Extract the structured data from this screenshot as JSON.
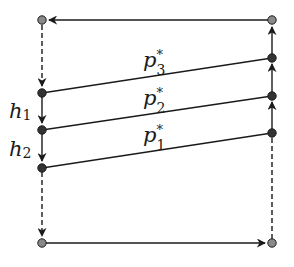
{
  "diagram": {
    "colors": {
      "line": "#1a1a1a",
      "node_dark": "#333333",
      "node_light": "#8a8a8a"
    },
    "nodes": {
      "left": [
        {
          "id": "L_top",
          "x": 42,
          "y": 20,
          "style": "light"
        },
        {
          "id": "L1",
          "x": 42,
          "y": 93,
          "style": "dark"
        },
        {
          "id": "L2",
          "x": 42,
          "y": 130,
          "style": "dark"
        },
        {
          "id": "L3",
          "x": 42,
          "y": 168,
          "style": "dark"
        },
        {
          "id": "L_bottom",
          "x": 42,
          "y": 243,
          "style": "light"
        }
      ],
      "right": [
        {
          "id": "R_top",
          "x": 272,
          "y": 20,
          "style": "light"
        },
        {
          "id": "R3",
          "x": 272,
          "y": 58,
          "style": "dark"
        },
        {
          "id": "R2",
          "x": 272,
          "y": 96,
          "style": "dark"
        },
        {
          "id": "R1",
          "x": 272,
          "y": 133,
          "style": "dark"
        },
        {
          "id": "R_bottom",
          "x": 272,
          "y": 243,
          "style": "light"
        }
      ]
    },
    "edges": [
      {
        "from": "R_top",
        "to": "L_top",
        "style": "solid",
        "arrow": true
      },
      {
        "from": "L_top",
        "to": "L1",
        "style": "dashed",
        "arrow": true
      },
      {
        "from": "L1",
        "to": "L2",
        "style": "solid",
        "arrow": true,
        "label": "h1"
      },
      {
        "from": "L2",
        "to": "L3",
        "style": "solid",
        "arrow": true,
        "label": "h2"
      },
      {
        "from": "L3",
        "to": "L_bottom",
        "style": "dashed",
        "arrow": true
      },
      {
        "from": "L_bottom",
        "to": "R_bottom",
        "style": "solid",
        "arrow": true
      },
      {
        "from": "R_bottom",
        "to": "R1",
        "style": "dashed",
        "arrow": false
      },
      {
        "from": "R1",
        "to": "R2",
        "style": "solid",
        "arrow": true
      },
      {
        "from": "R2",
        "to": "R3",
        "style": "solid",
        "arrow": true
      },
      {
        "from": "R3",
        "to": "R_top",
        "style": "solid",
        "arrow": true
      },
      {
        "from": "L1",
        "to": "R3",
        "style": "solid",
        "arrow": false,
        "label": "p3*"
      },
      {
        "from": "L2",
        "to": "R2",
        "style": "solid",
        "arrow": false,
        "label": "p2*"
      },
      {
        "from": "L3",
        "to": "R1",
        "style": "solid",
        "arrow": false,
        "label": "p1*"
      }
    ],
    "labels": {
      "h1": {
        "base": "h",
        "sub": "1"
      },
      "h2": {
        "base": "h",
        "sub": "2"
      },
      "p3": {
        "base": "p",
        "sup": "*",
        "sub": "3"
      },
      "p2": {
        "base": "p",
        "sup": "*",
        "sub": "2"
      },
      "p1": {
        "base": "p",
        "sup": "*",
        "sub": "1"
      }
    }
  }
}
